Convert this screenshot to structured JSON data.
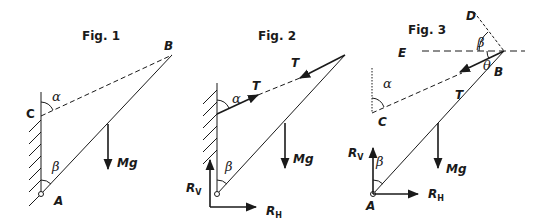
{
  "figures": [
    {
      "title": "Fig. 1",
      "labels": {
        "B": "B",
        "C": "C",
        "A": "A",
        "alpha": "α",
        "beta": "β",
        "weight": "Mg"
      }
    },
    {
      "title": "Fig. 2",
      "labels": {
        "T_upper": "T",
        "T_lower": "T",
        "alpha": "α",
        "beta": "β",
        "weight": "Mg",
        "Rv": "R",
        "Rv_sub": "V",
        "Rh": "R",
        "Rh_sub": "H"
      }
    },
    {
      "title": "Fig. 3",
      "labels": {
        "D": "D",
        "E": "E",
        "B": "B",
        "C": "C",
        "A": "A",
        "T": "T",
        "alpha": "α",
        "beta_top": "β",
        "theta": "θ",
        "beta_bottom": "β",
        "weight": "Mg",
        "Rv": "R",
        "Rv_sub": "V",
        "Rh": "R",
        "Rh_sub": "H"
      }
    }
  ],
  "colors": {
    "ink": "#1a1a1a",
    "background": "#ffffff"
  }
}
